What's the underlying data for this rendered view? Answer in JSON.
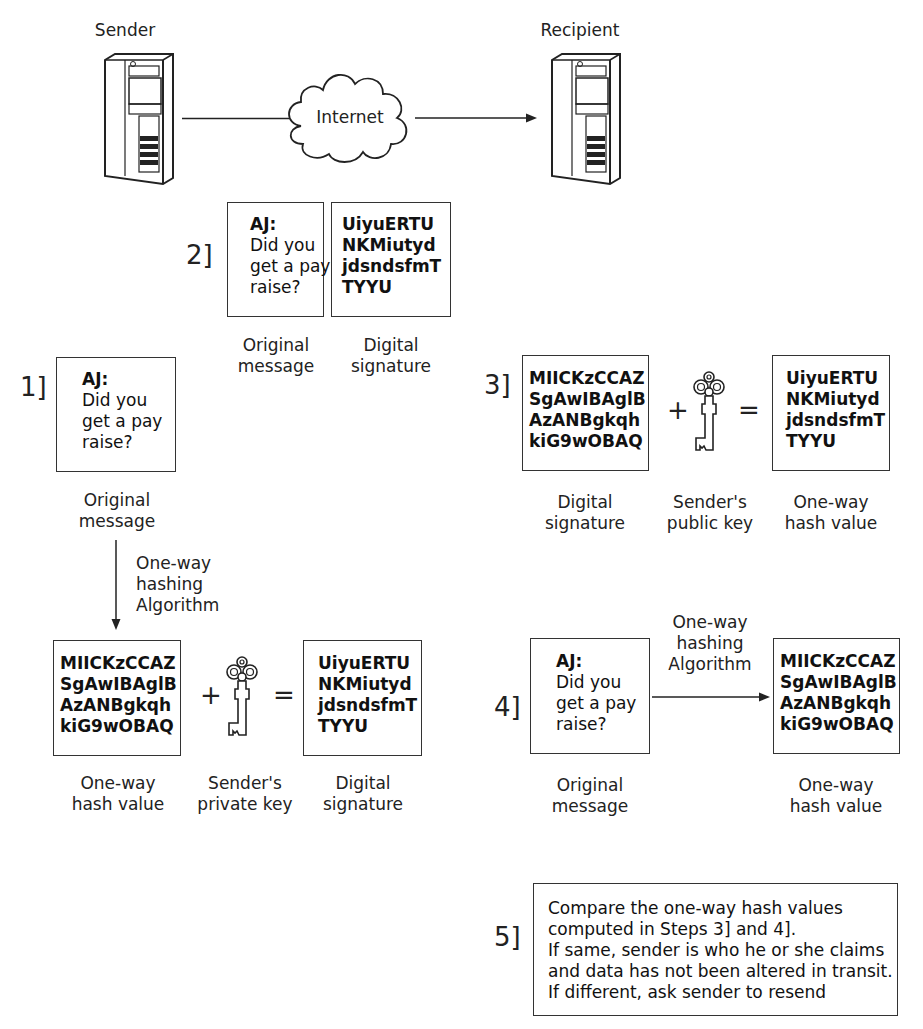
{
  "network": {
    "sender_label": "Sender",
    "recipient_label": "Recipient",
    "cloud_label": "Internet"
  },
  "step2": {
    "number": "2]",
    "message": {
      "header": "AJ:",
      "body": "Did you\nget a pay\nraise?"
    },
    "signature": "UiyuERTU\nNKMiutyd\njdsndsfmT\nTYYU",
    "message_caption": "Original\nmessage",
    "signature_caption": "Digital\nsignature"
  },
  "step1": {
    "number": "1]",
    "message": {
      "header": "AJ:",
      "body": "Did you\nget a pay\nraise?"
    },
    "message_caption": "Original\nmessage",
    "algorithm_label": "One-way\nhashing\nAlgorithm",
    "hash": "MIICKzCCAZ\nSgAwIBAglB\nAzANBgkqh\nkiG9wOBAQ",
    "plus": "+",
    "equals": "=",
    "signature": "UiyuERTU\nNKMiutyd\njdsndsfmT\nTYYU",
    "hash_caption": "One-way\nhash value",
    "key_caption": "Sender's\nprivate key",
    "signature_caption": "Digital\nsignature"
  },
  "step3": {
    "number": "3]",
    "signature": "MIICKzCCAZ\nSgAwIBAglB\nAzANBgkqh\nkiG9wOBAQ",
    "plus": "+",
    "equals": "=",
    "hash": "UiyuERTU\nNKMiutyd\njdsndsfmT\nTYYU",
    "signature_caption": "Digital\nsignature",
    "key_caption": "Sender's\npublic key",
    "hash_caption": "One-way\nhash value"
  },
  "step4": {
    "number": "4]",
    "message": {
      "header": "AJ:",
      "body": "Did you\nget a pay\nraise?"
    },
    "algorithm_label": "One-way\nhashing\nAlgorithm",
    "hash": "MIICKzCCAZ\nSgAwIBAglB\nAzANBgkqh\nkiG9wOBAQ",
    "message_caption": "Original\nmessage",
    "hash_caption": "One-way\nhash value"
  },
  "step5": {
    "number": "5]",
    "text": "Compare the one-way hash values\ncomputed in Steps 3] and 4].\nIf same, sender is who he or she claims\nand data has not been altered in transit.\nIf different, ask sender to resend"
  }
}
